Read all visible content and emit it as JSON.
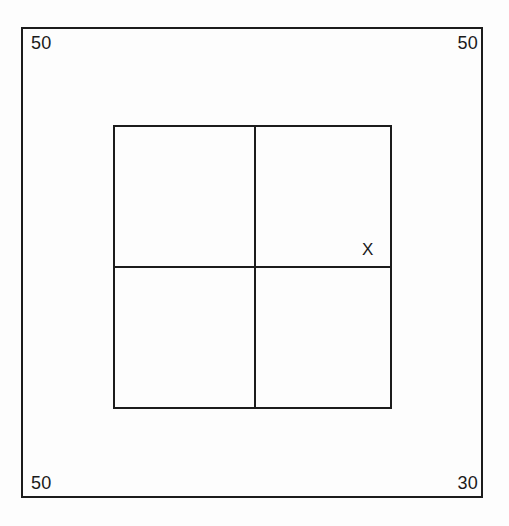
{
  "page": {
    "background_color": "#fdfdfd",
    "line_color": "#1c1c1c",
    "text_color": "#1a1a1a"
  },
  "outer_frame": {
    "name": "outer-border-rectangle"
  },
  "dimensions": {
    "top_left": "50",
    "top_right": "50",
    "bottom_left": "50",
    "bottom_right": "30"
  },
  "inner_square": {
    "name": "inner-square",
    "divider_vertical": "",
    "divider_horizontal": ""
  },
  "markers": {
    "x_label": "X"
  },
  "chart_data": {
    "type": "diagram",
    "shapes": [
      {
        "name": "outer-border-rectangle",
        "type": "rectangle",
        "x": 21,
        "y": 27,
        "width": 462,
        "height": 471,
        "stroke": "#1c1c1c",
        "stroke_width": 2.5,
        "fill": "none"
      },
      {
        "name": "inner-square",
        "type": "rectangle",
        "x": 113,
        "y": 125,
        "width": 279,
        "height": 284,
        "stroke": "#1c1c1c",
        "stroke_width": 2,
        "fill": "none"
      },
      {
        "name": "divider-vertical",
        "type": "line",
        "x1": 254,
        "y1": 125,
        "x2": 254,
        "y2": 409,
        "stroke": "#1c1c1c",
        "stroke_width": 2
      },
      {
        "name": "divider-horizontal",
        "type": "line",
        "x1": 113,
        "y1": 266,
        "x2": 392,
        "y2": 266,
        "stroke": "#1c1c1c",
        "stroke_width": 2
      }
    ],
    "annotations": [
      {
        "name": "dimension-top-left",
        "text": "50",
        "x": 31,
        "y": 43,
        "anchor": "start"
      },
      {
        "name": "dimension-top-right",
        "text": "50",
        "x": 473,
        "y": 43,
        "anchor": "end"
      },
      {
        "name": "dimension-bottom-left",
        "text": "50",
        "x": 31,
        "y": 482,
        "anchor": "start"
      },
      {
        "name": "dimension-bottom-right",
        "text": "30",
        "x": 473,
        "y": 482,
        "anchor": "end"
      },
      {
        "name": "marker-x",
        "text": "X",
        "x": 369,
        "y": 251,
        "anchor": "middle"
      }
    ]
  }
}
